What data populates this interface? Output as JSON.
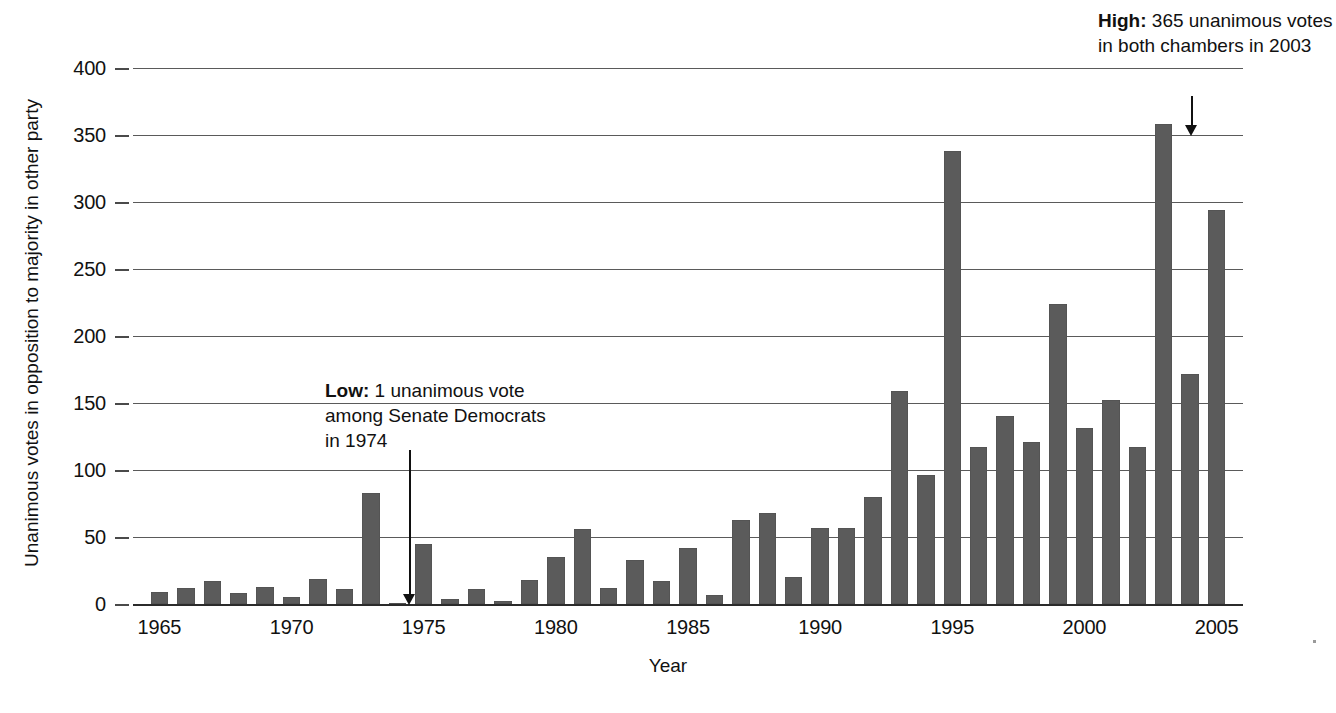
{
  "chart_data": {
    "type": "bar",
    "title": "",
    "xlabel": "Year",
    "ylabel": "Unanimous votes in opposition to majority in other party",
    "ylim": [
      0,
      400
    ],
    "yticks": [
      0,
      50,
      100,
      150,
      200,
      250,
      300,
      350,
      400
    ],
    "xticks": [
      1965,
      1970,
      1975,
      1980,
      1985,
      1990,
      1995,
      2000,
      2005
    ],
    "xlim": [
      1964,
      2006
    ],
    "grid": "horizontal",
    "legend": "none",
    "bar_color": "#5b5b5b",
    "categories": [
      1965,
      1966,
      1967,
      1968,
      1969,
      1970,
      1971,
      1972,
      1973,
      1974,
      1975,
      1976,
      1977,
      1978,
      1979,
      1980,
      1981,
      1982,
      1983,
      1984,
      1985,
      1986,
      1987,
      1988,
      1989,
      1990,
      1991,
      1992,
      1993,
      1994,
      1995,
      1996,
      1997,
      1998,
      1999,
      2000,
      2001,
      2002,
      2003,
      2004,
      2005
    ],
    "values": [
      9,
      12,
      17,
      8,
      13,
      5,
      19,
      11,
      83,
      1,
      45,
      4,
      11,
      2,
      18,
      35,
      56,
      12,
      33,
      17,
      42,
      7,
      63,
      68,
      20,
      57,
      57,
      80,
      159,
      96,
      338,
      117,
      140,
      121,
      224,
      131,
      152,
      117,
      358,
      172,
      294
    ],
    "annotations": [
      {
        "id": "low",
        "bold": "Low:",
        "text": " 1 unanimous vote among Senate Democrats in 1974",
        "points_to_year": 1974,
        "points_to_value": 1
      },
      {
        "id": "high",
        "bold": "High:",
        "text": " 365 unanimous votes in both chambers in 2003",
        "points_to_year": 2003,
        "points_to_value": 365
      }
    ]
  },
  "axis": {
    "y_title": "Unanimous votes in opposition to majority in other party",
    "x_title": "Year",
    "y_tick_labels": [
      "400",
      "350",
      "300",
      "250",
      "200",
      "150",
      "100",
      "50",
      "0"
    ],
    "x_tick_labels": [
      "1965",
      "1970",
      "1975",
      "1980",
      "1985",
      "1990",
      "1995",
      "2000",
      "2005"
    ]
  },
  "annotations": {
    "low": {
      "label": "Low:",
      "body": " 1 unanimous vote among Senate Democrats in 1974"
    },
    "high": {
      "label": "High:",
      "body": " 365 unanimous votes in both chambers in 2003"
    }
  }
}
